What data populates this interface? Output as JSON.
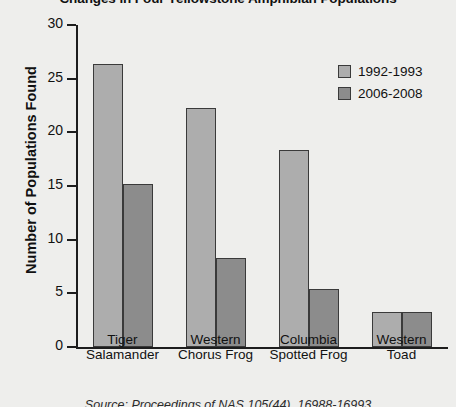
{
  "chart_data": {
    "type": "bar",
    "title": "Changes in Four Yellowstone Amphibian Populations",
    "xlabel": "",
    "ylabel": "Number of Populations Found",
    "categories": [
      "Tiger\nSalamander",
      "Western\nChorus Frog",
      "Columbia\nSpotted Frog",
      "Western\nToad"
    ],
    "series": [
      {
        "name": "1992-1993",
        "color": "#adadad",
        "values": [
          26.4,
          22.3,
          18.4,
          3.3
        ]
      },
      {
        "name": "2006-2008",
        "color": "#8c8c8c",
        "values": [
          15.2,
          8.3,
          5.4,
          3.3
        ]
      }
    ],
    "ylim": [
      0,
      30
    ],
    "yticks": [
      0,
      5,
      10,
      15,
      20,
      25,
      30
    ],
    "grid": false,
    "legend_position": "top-right"
  },
  "source": {
    "caption": "Source: Proceedings of NAS 105(44), 16988-16993"
  }
}
